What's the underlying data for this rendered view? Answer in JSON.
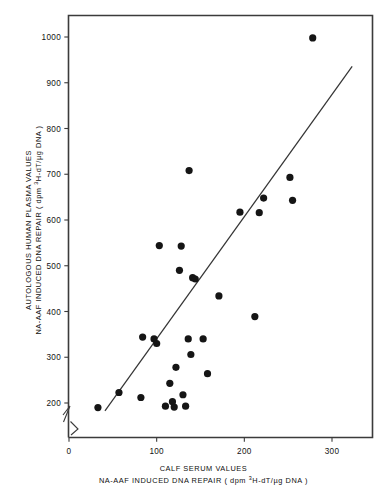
{
  "chart_data": {
    "type": "scatter",
    "title": "",
    "subtitle": "",
    "xlabel_line1": "CALF SERUM VALUES",
    "xlabel_line2_pre": "NA-AAF INDUCED DNA REPAIR ( dpm ",
    "xlabel_line2_sup": "3",
    "xlabel_line2_post": "H-dT/µg DNA )",
    "ylabel_line1": "AUTOLOGOUS HUMAN PLASMA VALUES",
    "ylabel_line2": "NA-AAF INDUCED DNA REPAIR ( dpm 3H-dT/µg DNA )",
    "xlim": [
      0,
      355
    ],
    "ylim": [
      150,
      1040
    ],
    "xticks": [
      0,
      100,
      200,
      300
    ],
    "xticklabels": [
      "0",
      "100",
      "200",
      "300"
    ],
    "yticks": [
      200,
      300,
      400,
      500,
      600,
      700,
      800,
      900,
      1000
    ],
    "yticklabels": [
      "200",
      "300",
      "400",
      "500",
      "600",
      "700",
      "800",
      "900",
      "1000"
    ],
    "grid": false,
    "legend": null,
    "axis_break_x": true,
    "axis_break_y": true,
    "marker": "filled-circle",
    "marker_color": "#151515",
    "marker_size_px": 5.4,
    "fit_line": {
      "type": "linear-regression",
      "color": "#353535",
      "x_start": 41,
      "y_start": 183,
      "x_end": 323,
      "y_end": 936
    },
    "points": [
      {
        "x": 33,
        "y": 190
      },
      {
        "x": 57,
        "y": 223
      },
      {
        "x": 82,
        "y": 212
      },
      {
        "x": 84,
        "y": 344
      },
      {
        "x": 97,
        "y": 340
      },
      {
        "x": 100,
        "y": 330
      },
      {
        "x": 103,
        "y": 544
      },
      {
        "x": 110,
        "y": 193
      },
      {
        "x": 115,
        "y": 243
      },
      {
        "x": 118,
        "y": 203
      },
      {
        "x": 120,
        "y": 191
      },
      {
        "x": 122,
        "y": 278
      },
      {
        "x": 126,
        "y": 490
      },
      {
        "x": 128,
        "y": 543
      },
      {
        "x": 130,
        "y": 218
      },
      {
        "x": 133,
        "y": 193
      },
      {
        "x": 136,
        "y": 340
      },
      {
        "x": 137,
        "y": 708
      },
      {
        "x": 139,
        "y": 306
      },
      {
        "x": 141,
        "y": 474
      },
      {
        "x": 144,
        "y": 471
      },
      {
        "x": 153,
        "y": 340
      },
      {
        "x": 158,
        "y": 264
      },
      {
        "x": 171,
        "y": 434
      },
      {
        "x": 195,
        "y": 617
      },
      {
        "x": 212,
        "y": 389
      },
      {
        "x": 217,
        "y": 616
      },
      {
        "x": 222,
        "y": 648
      },
      {
        "x": 252,
        "y": 693
      },
      {
        "x": 255,
        "y": 643
      },
      {
        "x": 278,
        "y": 998
      }
    ]
  }
}
